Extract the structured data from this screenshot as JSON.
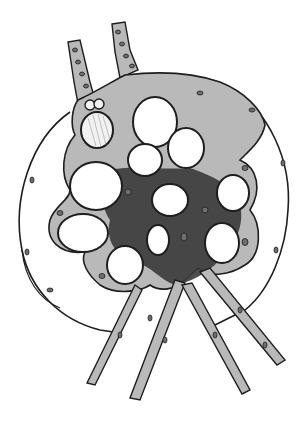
{
  "figure": {
    "colors": {
      "background": "#ffffff",
      "cytoplasm": "#b9b9b9",
      "dense_core": "#3a3a3a",
      "outline": "#1e1e1e",
      "lumen": "#ffffff",
      "nucleus": "#6f6f6f"
    },
    "lumens": [
      {
        "cx": 155,
        "cy": 122,
        "rx": 22,
        "ry": 25
      },
      {
        "cx": 145,
        "cy": 160,
        "rx": 17,
        "ry": 16
      },
      {
        "cx": 96,
        "cy": 186,
        "rx": 26,
        "ry": 24
      },
      {
        "cx": 186,
        "cy": 148,
        "rx": 18,
        "ry": 20
      },
      {
        "cx": 170,
        "cy": 200,
        "rx": 18,
        "ry": 16
      },
      {
        "cx": 233,
        "cy": 193,
        "rx": 16,
        "ry": 18
      },
      {
        "cx": 83,
        "cy": 233,
        "rx": 25,
        "ry": 19
      },
      {
        "cx": 125,
        "cy": 265,
        "rx": 18,
        "ry": 19
      },
      {
        "cx": 158,
        "cy": 240,
        "rx": 11,
        "ry": 15
      },
      {
        "cx": 222,
        "cy": 243,
        "rx": 17,
        "ry": 20
      }
    ]
  }
}
